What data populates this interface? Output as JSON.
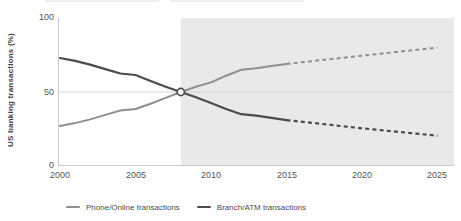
{
  "chart_data": {
    "type": "line",
    "title": "",
    "ylabel": "US banking transactions (%)",
    "xlabel": "",
    "y_ticks": [
      0,
      50,
      100
    ],
    "x_ticks": [
      2000,
      2005,
      2010,
      2015,
      2020,
      2025
    ],
    "ylim": [
      0,
      100
    ],
    "xlim": [
      2000,
      2026
    ],
    "grid": "horizontal line at 50 only",
    "forecast_shading": {
      "from_year": 2008,
      "color": "#e9e9e9"
    },
    "projection_style": "dashed after 2015",
    "series": [
      {
        "name": "Phone/Online transactions",
        "color": "#8f8f8f",
        "x": [
          2000,
          2001,
          2002,
          2003,
          2004,
          2005,
          2006,
          2007,
          2008,
          2009,
          2010,
          2011,
          2012,
          2013,
          2014,
          2015
        ],
        "values": [
          27,
          29,
          31.5,
          34.5,
          37.5,
          38.5,
          42,
          46,
          50,
          53.5,
          56.5,
          61,
          65,
          66,
          67.5,
          69
        ],
        "projection_x": [
          2015,
          2020,
          2025
        ],
        "projection_values": [
          69,
          74.5,
          80
        ]
      },
      {
        "name": "Branch/ATM transactions",
        "color": "#4b4b4b",
        "x": [
          2000,
          2001,
          2002,
          2003,
          2004,
          2005,
          2006,
          2007,
          2008,
          2009,
          2010,
          2011,
          2012,
          2013,
          2014,
          2015
        ],
        "values": [
          73,
          71,
          68.5,
          65.5,
          62.5,
          61.5,
          57.5,
          53.5,
          50,
          46.5,
          42.5,
          38.5,
          35,
          34,
          32.5,
          31
        ],
        "projection_x": [
          2015,
          2020,
          2025
        ],
        "projection_values": [
          31,
          25.5,
          20.5
        ]
      }
    ],
    "crossover_marker": {
      "year": 2008,
      "value": 50
    },
    "legend_position": "bottom"
  }
}
